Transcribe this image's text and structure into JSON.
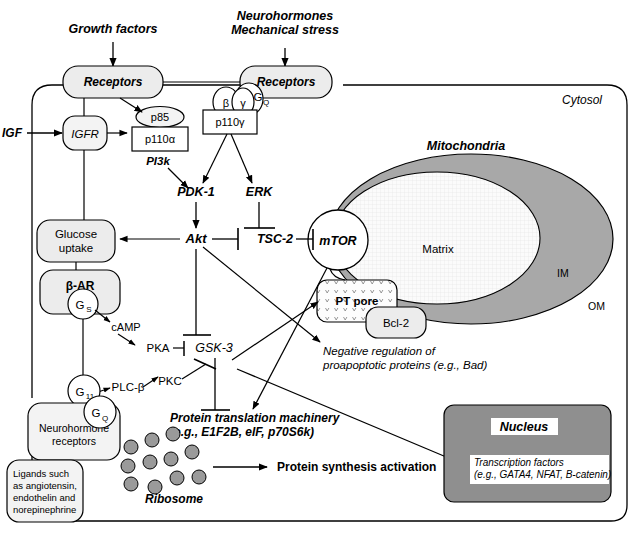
{
  "diagram": {
    "compartments": {
      "cytosol_label": "Cytosol",
      "mitochondria_label": "Mitochondria",
      "matrix_label": "Matrix",
      "inner_membrane_label": "IM",
      "outer_membrane_label": "OM",
      "nucleus_label": "Nucleus"
    },
    "stimuli": {
      "growth_factors": "Growth factors",
      "neurohormones_line1": "Neurohormones",
      "neurohormones_line2": "Mechanical stress",
      "igf": "IGF"
    },
    "receptors": {
      "left": "Receptors",
      "right": "Receptors",
      "igfr": "IGFR",
      "beta_ar": "β-AR",
      "neurohormone_line1": "Neurohormone",
      "neurohormone_line2": "receptors"
    },
    "ligands_box": {
      "line1": "Ligands such",
      "line2": "as angiotensin,",
      "line3": "endothelin and",
      "line4": "norepinephrine"
    },
    "g_proteins": {
      "beta": "β",
      "gamma": "γ",
      "gq_top": "G",
      "gq_top_sub": "Q",
      "gs": "G",
      "gs_sub": "S",
      "g11": "G",
      "g11_sub": "11",
      "gq_bottom": "G",
      "gq_bottom_sub": "Q"
    },
    "nodes": {
      "p85": "p85",
      "p110a": "p110α",
      "p110g": "p110γ",
      "pi3k": "PI3k",
      "pdk1": "PDK-1",
      "erk": "ERK",
      "akt": "Akt",
      "tsc2": "TSC-2",
      "mtor": "mTOR",
      "pt_pore": "PT pore",
      "bcl2": "Bcl-2",
      "glucose_line1": "Glucose",
      "glucose_line2": "uptake",
      "camp": "cAMP",
      "pka": "PKA",
      "pkc": "PKC",
      "plcb": "PLC-β",
      "gsk3": "GSK-3",
      "ribosome": "Ribosome"
    },
    "annotations": {
      "negative_reg_line1": "Negative regulation of",
      "negative_reg_line2": "proapoptotic proteins (e.g., Bad)",
      "translation_line1": "Protein translation machinery",
      "translation_line2": "(e.g., E1F2B, eIF, p70S6k)",
      "protein_synthesis": "Protein synthesis activation",
      "transcription_line1": "Transcription factors",
      "transcription_line2": "(e.g., GATA4, NFAT, B-catenin)"
    },
    "colors": {
      "node_fill": "#ececec",
      "mito_outer": "#a8a8a8",
      "mito_matrix": "#fbfbfb",
      "nucleus_fill": "#8f8f8f",
      "ribosome_fill": "#9a9a9a",
      "stroke": "#000000",
      "white": "#ffffff"
    },
    "ribosome_dots": [
      {
        "cx": 131,
        "cy": 447
      },
      {
        "cx": 152,
        "cy": 440
      },
      {
        "cx": 173,
        "cy": 434
      },
      {
        "cx": 128,
        "cy": 466
      },
      {
        "cx": 150,
        "cy": 462
      },
      {
        "cx": 171,
        "cy": 459
      },
      {
        "cx": 192,
        "cy": 452
      },
      {
        "cx": 131,
        "cy": 484
      },
      {
        "cx": 155,
        "cy": 487
      },
      {
        "cx": 177,
        "cy": 478
      },
      {
        "cx": 199,
        "cy": 477
      }
    ]
  }
}
